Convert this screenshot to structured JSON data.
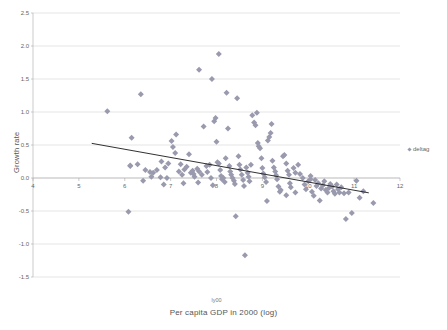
{
  "chart_data": {
    "type": "scatter",
    "title": "",
    "xlabel": "Per capita GDP in 2000 (log)",
    "ylabel": "Growth rate",
    "series_tag": "ly00",
    "xlim": [
      4,
      12
    ],
    "ylim": [
      -1.5,
      2.5
    ],
    "xticks": [
      4,
      5,
      6,
      7,
      8,
      9,
      10,
      11,
      12
    ],
    "yticks": [
      -1.5,
      -1.0,
      -0.5,
      0.0,
      0.5,
      1.0,
      1.5,
      2.0,
      2.5
    ],
    "xtick_labels": [
      "4",
      "5",
      "6",
      "7",
      "8",
      "9",
      "10",
      "11",
      "12"
    ],
    "ytick_labels": [
      "-1.5",
      "-1.0",
      "-0.5",
      "0.0",
      "0.5",
      "1.0",
      "1.5",
      "2.0",
      "2.5"
    ],
    "grid": "horizontal",
    "axis_crossing_y": 0.0,
    "legend": {
      "position": "right",
      "entries": [
        {
          "name": "deltag",
          "marker": "diamond",
          "color": "#9a9aae"
        }
      ]
    },
    "marker": {
      "shape": "diamond",
      "color": "#9a9aae",
      "size": 3
    },
    "trendline": {
      "color": "#1a1a1a",
      "x_start": 5.28,
      "y_start": 0.525,
      "x_end": 11.32,
      "y_end": -0.225
    },
    "series": [
      {
        "name": "deltag",
        "points": [
          [
            5.62,
            1.01
          ],
          [
            6.35,
            1.27
          ],
          [
            6.15,
            0.61
          ],
          [
            6.12,
            0.18
          ],
          [
            6.28,
            0.21
          ],
          [
            6.08,
            -0.51
          ],
          [
            6.12,
            0.19
          ],
          [
            6.45,
            0.12
          ],
          [
            6.55,
            0.09
          ],
          [
            6.4,
            -0.04
          ],
          [
            6.62,
            0.08
          ],
          [
            6.7,
            0.12
          ],
          [
            6.58,
            0.02
          ],
          [
            6.78,
            0.01
          ],
          [
            6.92,
            0.0
          ],
          [
            6.8,
            0.25
          ],
          [
            6.88,
            0.16
          ],
          [
            6.95,
            0.22
          ],
          [
            6.85,
            -0.1
          ],
          [
            7.02,
            0.56
          ],
          [
            7.05,
            0.47
          ],
          [
            7.12,
            0.66
          ],
          [
            7.1,
            0.38
          ],
          [
            7.22,
            0.21
          ],
          [
            7.18,
            0.1
          ],
          [
            7.25,
            0.05
          ],
          [
            7.3,
            0.13
          ],
          [
            7.35,
            0.17
          ],
          [
            7.28,
            -0.08
          ],
          [
            7.4,
            0.36
          ],
          [
            7.44,
            0.08
          ],
          [
            7.5,
            0.06
          ],
          [
            7.48,
            0.11
          ],
          [
            7.52,
            0.02
          ],
          [
            7.58,
            0.14
          ],
          [
            7.62,
            0.1
          ],
          [
            7.6,
            -0.07
          ],
          [
            7.68,
            0.05
          ],
          [
            7.72,
            0.78
          ],
          [
            7.78,
            0.18
          ],
          [
            7.8,
            0.09
          ],
          [
            7.85,
            0.2
          ],
          [
            7.88,
            0.0
          ],
          [
            7.92,
            -0.11
          ],
          [
            7.95,
            0.86
          ],
          [
            7.98,
            0.91
          ],
          [
            8.0,
            0.55
          ],
          [
            8.02,
            0.24
          ],
          [
            8.05,
            0.22
          ],
          [
            8.08,
            0.12
          ],
          [
            8.1,
            0.03
          ],
          [
            8.12,
            -0.02
          ],
          [
            8.15,
            0.0
          ],
          [
            8.18,
            -0.06
          ],
          [
            8.2,
            0.3
          ],
          [
            8.22,
            1.29
          ],
          [
            8.05,
            1.88
          ],
          [
            7.9,
            1.5
          ],
          [
            7.62,
            1.64
          ],
          [
            8.25,
            0.75
          ],
          [
            8.28,
            0.18
          ],
          [
            8.3,
            0.1
          ],
          [
            8.32,
            0.05
          ],
          [
            8.35,
            0.0
          ],
          [
            8.38,
            -0.04
          ],
          [
            8.4,
            -0.09
          ],
          [
            8.42,
            -0.58
          ],
          [
            8.45,
            1.21
          ],
          [
            8.48,
            0.33
          ],
          [
            8.5,
            0.2
          ],
          [
            8.52,
            0.13
          ],
          [
            8.55,
            0.05
          ],
          [
            8.58,
            -0.03
          ],
          [
            8.6,
            -0.12
          ],
          [
            8.62,
            -1.17
          ],
          [
            8.65,
            0.16
          ],
          [
            8.68,
            0.08
          ],
          [
            8.7,
            0.02
          ],
          [
            8.72,
            -0.05
          ],
          [
            8.75,
            0.2
          ],
          [
            8.78,
            0.95
          ],
          [
            8.82,
            0.84
          ],
          [
            8.85,
            0.8
          ],
          [
            8.88,
            0.99
          ],
          [
            8.9,
            0.53
          ],
          [
            8.92,
            0.48
          ],
          [
            8.95,
            0.45
          ],
          [
            8.98,
            0.3
          ],
          [
            9.0,
            0.15
          ],
          [
            9.02,
            0.07
          ],
          [
            9.05,
            0.01
          ],
          [
            9.08,
            -0.06
          ],
          [
            9.1,
            -0.35
          ],
          [
            9.12,
            0.57
          ],
          [
            9.15,
            0.62
          ],
          [
            9.18,
            0.68
          ],
          [
            9.2,
            0.82
          ],
          [
            9.22,
            0.26
          ],
          [
            9.25,
            0.16
          ],
          [
            9.28,
            0.1
          ],
          [
            9.3,
            0.04
          ],
          [
            9.32,
            -0.02
          ],
          [
            9.35,
            -0.13
          ],
          [
            9.38,
            -0.21
          ],
          [
            9.4,
            -0.18
          ],
          [
            9.45,
            0.33
          ],
          [
            9.48,
            0.35
          ],
          [
            9.52,
            0.22
          ],
          [
            9.55,
            0.11
          ],
          [
            9.58,
            0.05
          ],
          [
            9.6,
            -0.08
          ],
          [
            9.62,
            -0.14
          ],
          [
            9.68,
            0.15
          ],
          [
            9.72,
            0.08
          ],
          [
            9.78,
            0.2
          ],
          [
            9.82,
            0.06
          ],
          [
            9.88,
            0.0
          ],
          [
            9.92,
            -0.1
          ],
          [
            9.95,
            -0.17
          ],
          [
            10.0,
            -0.05
          ],
          [
            10.05,
            -0.02
          ],
          [
            10.08,
            -0.21
          ],
          [
            10.12,
            -0.27
          ],
          [
            10.18,
            -0.12
          ],
          [
            10.22,
            -0.08
          ],
          [
            10.25,
            -0.34
          ],
          [
            10.28,
            -0.16
          ],
          [
            10.32,
            -0.11
          ],
          [
            10.35,
            -0.05
          ],
          [
            10.38,
            -0.18
          ],
          [
            10.42,
            -0.22
          ],
          [
            10.45,
            -0.15
          ],
          [
            10.48,
            -0.09
          ],
          [
            10.52,
            -0.13
          ],
          [
            10.55,
            -0.2
          ],
          [
            10.58,
            -0.24
          ],
          [
            10.62,
            -0.1
          ],
          [
            10.65,
            -0.17
          ],
          [
            10.68,
            -0.22
          ],
          [
            10.72,
            -0.14
          ],
          [
            10.78,
            -0.23
          ],
          [
            10.82,
            -0.62
          ],
          [
            10.88,
            -0.22
          ],
          [
            10.95,
            -0.53
          ],
          [
            11.05,
            -0.04
          ],
          [
            11.12,
            -0.3
          ],
          [
            11.42,
            -0.38
          ],
          [
            11.2,
            -0.2
          ],
          [
            10.05,
            0.03
          ],
          [
            10.15,
            -0.03
          ],
          [
            9.72,
            -0.22
          ],
          [
            9.52,
            -0.26
          ]
        ]
      }
    ]
  }
}
